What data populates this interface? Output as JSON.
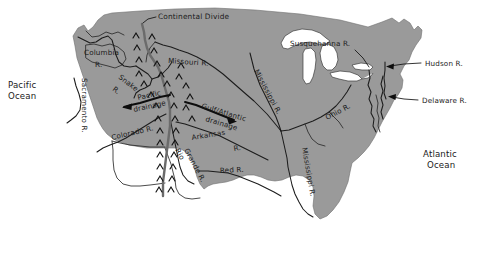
{
  "map": {
    "title": "Drainage divides and major rivers of the United States",
    "colors": {
      "land": "#9a9a9a",
      "water": "#ffffff",
      "river": "#1c1c1c",
      "divide": "#6b6b6b",
      "text": "#1a1a1a",
      "background": "#ffffff"
    },
    "oceans": [
      {
        "id": "pacific-ocean",
        "line1": "Pacific",
        "line2": "Ocean"
      },
      {
        "id": "atlantic-ocean",
        "line1": "Atlantic",
        "line2": "Ocean"
      }
    ],
    "divide": {
      "label": "Continental Divide",
      "symbol": "chevron-ridge"
    },
    "drainage_arrows": [
      {
        "id": "pacific-drainage",
        "line1": "Pacific",
        "line2": "drainage",
        "direction": "west"
      },
      {
        "id": "gulf-atlantic-drainage",
        "line1": "Gulf/Atlantic",
        "line2": "drainage",
        "direction": "east"
      }
    ],
    "rivers": [
      {
        "id": "columbia-river",
        "line1": "Columbia",
        "line2": "R."
      },
      {
        "id": "snake-river",
        "line1": "Snake",
        "line2": "R."
      },
      {
        "id": "sacramento-river",
        "label": "Sacramento R."
      },
      {
        "id": "colorado-river",
        "label": "Colorado R."
      },
      {
        "id": "rio-grande-river",
        "line1": "Rio",
        "line2": "Grande R."
      },
      {
        "id": "missouri-river",
        "label": "Missouri R."
      },
      {
        "id": "arkansas-river",
        "line1": "Arkansas",
        "line2": "R."
      },
      {
        "id": "red-river",
        "label": "Red R."
      },
      {
        "id": "mississippi-river-upper",
        "label": "Mississippi R."
      },
      {
        "id": "mississippi-river-lower",
        "label": "Mississippi R."
      },
      {
        "id": "ohio-river",
        "label": "Ohio R."
      },
      {
        "id": "susquehanna-river",
        "label": "Susquehanna R."
      },
      {
        "id": "hudson-river",
        "label": "Hudson R."
      },
      {
        "id": "delaware-river",
        "label": "Delaware R."
      }
    ]
  }
}
